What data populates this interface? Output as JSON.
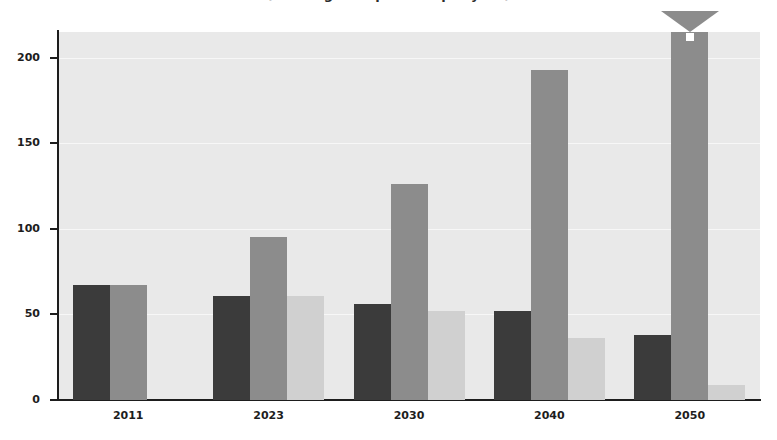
{
  "chart_data": {
    "type": "bar",
    "title": "(in milligrams per litre per year)",
    "xlabel": "",
    "ylabel": "",
    "categories": [
      "2011",
      "2023",
      "2030",
      "2040",
      "2050"
    ],
    "series": [
      {
        "name": "series-1",
        "color": "#3b3b3b",
        "values": [
          67,
          61,
          56,
          52,
          38
        ]
      },
      {
        "name": "series-2",
        "color": "#8c8c8c",
        "values": [
          67,
          95,
          126,
          193,
          215
        ]
      },
      {
        "name": "series-3",
        "color": "#d0d0d0",
        "values": [
          0,
          61,
          52,
          36,
          9
        ]
      }
    ],
    "ylim": [
      0,
      215
    ],
    "yticks": [
      0,
      50,
      100,
      150,
      200
    ],
    "ytick_labels": [
      "0",
      "50",
      "100",
      "150",
      "200"
    ],
    "grid": true,
    "grid_color": "#f7f7f7",
    "plot_background": "#e9e9e9",
    "legend": "none",
    "annotations": [
      {
        "name": "overflow-arrow",
        "category": "2050",
        "series": "series-2",
        "note": "bar clipped at top of axis and capped with an upward arrowhead indicating value exceeds the axis range"
      }
    ]
  }
}
